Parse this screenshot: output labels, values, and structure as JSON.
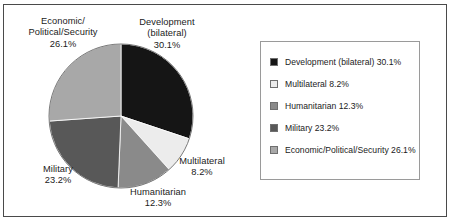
{
  "chart_data": {
    "type": "pie",
    "title": "",
    "subtitle": "",
    "xlabel": "",
    "ylabel": "",
    "grid": false,
    "legend_position": "right",
    "start_angle_deg": 0,
    "direction": "clockwise",
    "categories": [
      "Development (bilateral)",
      "Multilateral",
      "Humanitarian",
      "Military",
      "Economic/Political/Security"
    ],
    "values": [
      30.1,
      8.2,
      12.3,
      23.2,
      26.1
    ],
    "value_unit": "%",
    "colors": [
      "#151515",
      "#ececec",
      "#8a8a8a",
      "#585858",
      "#a8a8a8"
    ],
    "slices": [
      {
        "label": "Development (bilateral)",
        "value": 30.1,
        "value_text": "30.1%",
        "color": "#151515"
      },
      {
        "label": "Multilateral",
        "value": 8.2,
        "value_text": "8.2%",
        "color": "#ececec"
      },
      {
        "label": "Humanitarian",
        "value": 12.3,
        "value_text": "12.3%",
        "color": "#8a8a8a"
      },
      {
        "label": "Military",
        "value": 23.2,
        "value_text": "23.2%",
        "color": "#585858"
      },
      {
        "label": "Economic/Political/Security",
        "value": 26.1,
        "value_text": "26.1%",
        "color": "#a8a8a8"
      }
    ]
  },
  "pie_labels": {
    "economic": {
      "line1": "Economic/",
      "line2": "Political/Security",
      "line3": "26.1%"
    },
    "development": {
      "line1": "Development",
      "line2": "(bilateral)",
      "line3": "30.1%"
    },
    "multilateral": {
      "line1": "Multilateral",
      "line2": "8.2%"
    },
    "humanitarian": {
      "line1": "Humanitarian",
      "line2": "12.3%"
    },
    "military": {
      "line1": "Military",
      "line2": "23.2%"
    }
  },
  "legend": {
    "items": [
      {
        "label": "Development (bilateral) 30.1%",
        "color": "#151515"
      },
      {
        "label": "Multilateral 8.2%",
        "color": "#ececec"
      },
      {
        "label": "Humanitarian 12.3%",
        "color": "#8a8a8a"
      },
      {
        "label": "Military 23.2%",
        "color": "#585858"
      },
      {
        "label": "Economic/Political/Security 26.1%",
        "color": "#a8a8a8"
      }
    ]
  }
}
